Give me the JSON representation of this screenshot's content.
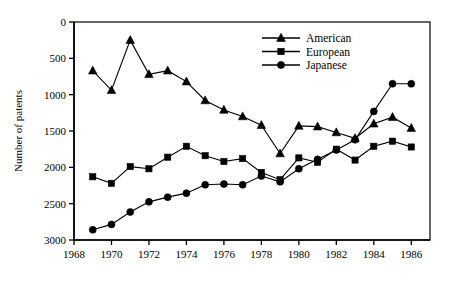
{
  "chart_data": {
    "type": "line",
    "title": "",
    "xlabel": "",
    "ylabel": "Number of patents",
    "xlim": [
      1968,
      1987
    ],
    "ylim": [
      0,
      3000
    ],
    "grid": false,
    "legend_position": "top-right",
    "xticks": [
      1968,
      1970,
      1972,
      1974,
      1976,
      1978,
      1980,
      1982,
      1984,
      1986
    ],
    "yticks": [
      0,
      500,
      1000,
      1500,
      2000,
      2500,
      3000
    ],
    "x": [
      1969,
      1970,
      1971,
      1972,
      1973,
      1974,
      1975,
      1976,
      1977,
      1978,
      1979,
      1980,
      1981,
      1982,
      1983,
      1984,
      1985,
      1986
    ],
    "series": [
      {
        "name": "American",
        "marker": "triangle",
        "values": [
          2330,
          2060,
          2750,
          2280,
          2330,
          2180,
          1920,
          1790,
          1700,
          1580,
          1190,
          1570,
          1560,
          1480,
          1400,
          1600,
          1690,
          1540
        ]
      },
      {
        "name": "European",
        "marker": "square",
        "values": [
          870,
          780,
          1010,
          980,
          1140,
          1290,
          1160,
          1080,
          1120,
          930,
          830,
          1130,
          1070,
          1250,
          1100,
          1290,
          1360,
          1280
        ]
      },
      {
        "name": "Japanese",
        "marker": "circle",
        "values": [
          140,
          215,
          385,
          525,
          590,
          645,
          760,
          770,
          760,
          880,
          800,
          980,
          1110,
          1240,
          1380,
          1770,
          2150,
          2150
        ]
      }
    ]
  },
  "legend": {
    "items": [
      {
        "label": "American",
        "marker": "triangle"
      },
      {
        "label": "European",
        "marker": "square"
      },
      {
        "label": "Japanese",
        "marker": "circle"
      }
    ]
  },
  "axis": {
    "y_title": "Number of patents",
    "y_tick_labels": [
      "3000",
      "2500",
      "2000",
      "1500",
      "1000",
      "500",
      "0"
    ],
    "x_tick_labels": [
      "1968",
      "1970",
      "1972",
      "1974",
      "1976",
      "1978",
      "1980",
      "1982",
      "1984",
      "1986"
    ]
  }
}
